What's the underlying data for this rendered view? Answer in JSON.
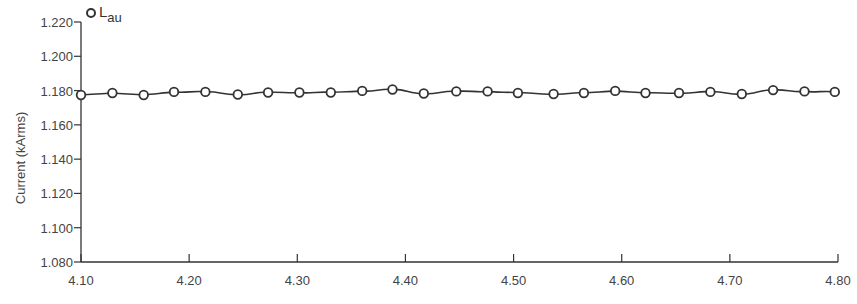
{
  "chart_data": {
    "type": "line",
    "title": "",
    "xlabel": "",
    "ylabel": "Current (kArms)",
    "xlim": [
      4.1,
      4.8
    ],
    "ylim": [
      1.08,
      1.22
    ],
    "x_ticks": [
      "4.10",
      "4.20",
      "4.30",
      "4.40",
      "4.50",
      "4.60",
      "4.70",
      "4.80"
    ],
    "y_ticks": [
      "1.220",
      "1.200",
      "1.180",
      "1.160",
      "1.140",
      "1.120",
      "1.100",
      "1.080"
    ],
    "grid": false,
    "legend_position": "top-left",
    "series": [
      {
        "name": "Lau",
        "legend_main": "L",
        "legend_sub": "au",
        "marker": "hollow-circle",
        "color": "#333333",
        "x": [
          4.1,
          4.129,
          4.158,
          4.186,
          4.215,
          4.245,
          4.273,
          4.302,
          4.331,
          4.36,
          4.388,
          4.417,
          4.447,
          4.476,
          4.504,
          4.537,
          4.565,
          4.594,
          4.622,
          4.653,
          4.682,
          4.711,
          4.74,
          4.769,
          4.797
        ],
        "values": [
          1.1774,
          1.1786,
          1.1774,
          1.1792,
          1.1792,
          1.1777,
          1.1789,
          1.1789,
          1.1789,
          1.1798,
          1.1806,
          1.1783,
          1.1795,
          1.1795,
          1.1786,
          1.178,
          1.1786,
          1.1798,
          1.1786,
          1.1786,
          1.1792,
          1.178,
          1.1803,
          1.1795,
          1.1792
        ]
      }
    ]
  },
  "legend": {
    "label_main": "L",
    "label_sub": "au"
  },
  "axes": {
    "ylabel": "Current (kArms)"
  }
}
